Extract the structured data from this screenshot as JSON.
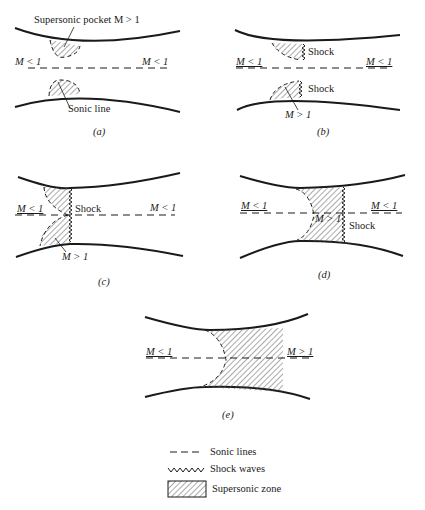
{
  "panels": {
    "a": {
      "caption": "(a)",
      "pocket_label": "Supersonic pocket M > 1",
      "left_mach": "M < 1",
      "right_mach": "M < 1",
      "sonic_label": "Sonic line"
    },
    "b": {
      "caption": "(b)",
      "left_mach": "M < 1",
      "right_mach": "M < 1",
      "shock_top": "Shock",
      "shock_bottom": "Shock",
      "mach_inside": "M > 1"
    },
    "c": {
      "caption": "(c)",
      "left_mach": "M < 1",
      "right_mach": "M < 1",
      "shock": "Shock",
      "mach_inside": "M > 1"
    },
    "d": {
      "caption": "(d)",
      "left_mach": "M < 1",
      "right_mach": "M < 1",
      "shock": "Shock",
      "mach_inside": "M > 1"
    },
    "e": {
      "caption": "(e)",
      "left_mach": "M < 1",
      "right_mach": "M > 1"
    }
  },
  "legend": {
    "items": [
      {
        "symbol": "dashed-line",
        "label": "Sonic lines"
      },
      {
        "symbol": "zigzag",
        "label": "Shock waves"
      },
      {
        "symbol": "hatched-box",
        "label": "Supersonic zone"
      }
    ]
  },
  "colors": {
    "line": "#1a1a1a",
    "hatch": "#555555",
    "background": "#ffffff"
  }
}
